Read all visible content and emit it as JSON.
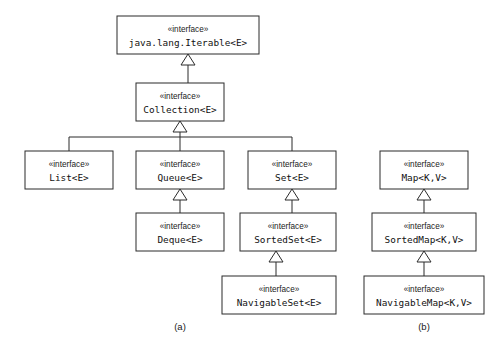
{
  "diagram": {
    "stereotype_label": "«interface»",
    "background_color": "#ffffff",
    "line_color": "#2b2b2b",
    "box_fill": "#ffffff",
    "nodes": [
      {
        "id": "iterable",
        "name": "java.lang.Iterable<E>",
        "stereotype": "«interface»",
        "x": 117,
        "y": 16,
        "w": 142,
        "h": 38,
        "group": "a"
      },
      {
        "id": "collection",
        "name": "Collection<E>",
        "stereotype": "«interface»",
        "x": 136,
        "y": 83,
        "w": 88,
        "h": 38,
        "group": "a"
      },
      {
        "id": "list",
        "name": "List<E>",
        "stereotype": "«interface»",
        "x": 25,
        "y": 151,
        "w": 88,
        "h": 38,
        "group": "a"
      },
      {
        "id": "queue",
        "name": "Queue<E>",
        "stereotype": "«interface»",
        "x": 136,
        "y": 151,
        "w": 88,
        "h": 38,
        "group": "a"
      },
      {
        "id": "set",
        "name": "Set<E>",
        "stereotype": "«interface»",
        "x": 248,
        "y": 151,
        "w": 88,
        "h": 38,
        "group": "a"
      },
      {
        "id": "deque",
        "name": "Deque<E>",
        "stereotype": "«interface»",
        "x": 136,
        "y": 213,
        "w": 88,
        "h": 38,
        "group": "a"
      },
      {
        "id": "sortedset",
        "name": "SortedSet<E>",
        "stereotype": "«interface»",
        "x": 240,
        "y": 213,
        "w": 96,
        "h": 38,
        "group": "a"
      },
      {
        "id": "navigableset",
        "name": "NavigableSet<E>",
        "stereotype": "«interface»",
        "x": 222,
        "y": 276,
        "w": 114,
        "h": 38,
        "group": "a"
      },
      {
        "id": "map",
        "name": "Map<K,V>",
        "stereotype": "«interface»",
        "x": 380,
        "y": 151,
        "w": 88,
        "h": 38,
        "group": "b"
      },
      {
        "id": "sortedmap",
        "name": "SortedMap<K,V>",
        "stereotype": "«interface»",
        "x": 372,
        "y": 213,
        "w": 104,
        "h": 38,
        "group": "b"
      },
      {
        "id": "navigablemap",
        "name": "NavigableMap<K,V>",
        "stereotype": "«interface»",
        "x": 364,
        "y": 276,
        "w": 120,
        "h": 38,
        "group": "b"
      }
    ],
    "edges": [
      {
        "id": "collection-iterable",
        "from": "collection",
        "to": "iterable",
        "kind": "generalization",
        "style": "direct",
        "arrow_x": 188,
        "arrow_y": 54,
        "tail_x": 188,
        "tail_y": 83
      },
      {
        "id": "children-collection",
        "from": "list-queue-set",
        "to": "collection",
        "kind": "generalization",
        "style": "bus",
        "arrow_x": 180,
        "arrow_y": 121,
        "bus_y": 137,
        "branch_xs": [
          69,
          180,
          292
        ],
        "child_top_y": 151
      },
      {
        "id": "deque-queue",
        "from": "deque",
        "to": "queue",
        "kind": "generalization",
        "style": "direct",
        "arrow_x": 180,
        "arrow_y": 189,
        "tail_x": 180,
        "tail_y": 213
      },
      {
        "id": "sortedset-set",
        "from": "sortedset",
        "to": "set",
        "kind": "generalization",
        "style": "direct",
        "arrow_x": 292,
        "arrow_y": 189,
        "tail_x": 292,
        "tail_y": 213
      },
      {
        "id": "navigableset-sortedset",
        "from": "navigableset",
        "to": "sortedset",
        "kind": "generalization",
        "style": "direct",
        "arrow_x": 276,
        "arrow_y": 251,
        "tail_x": 276,
        "tail_y": 276
      },
      {
        "id": "sortedmap-map",
        "from": "sortedmap",
        "to": "map",
        "kind": "generalization",
        "style": "direct",
        "arrow_x": 424,
        "arrow_y": 189,
        "tail_x": 424,
        "tail_y": 213
      },
      {
        "id": "navigablemap-sortedmap",
        "from": "navigablemap",
        "to": "sortedmap",
        "kind": "generalization",
        "style": "direct",
        "arrow_x": 424,
        "arrow_y": 251,
        "tail_x": 424,
        "tail_y": 276
      }
    ],
    "captions": [
      {
        "id": "caption-a",
        "label": "(a)",
        "x": 180,
        "y": 327
      },
      {
        "id": "caption-b",
        "label": "(b)",
        "x": 424,
        "y": 327
      }
    ]
  }
}
